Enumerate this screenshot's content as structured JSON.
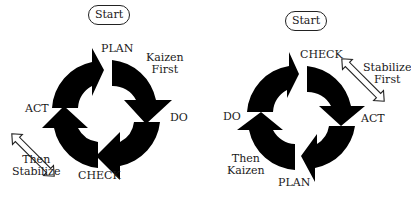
{
  "diagrams": [
    {
      "id": "left",
      "start_label": "Start",
      "stages": {
        "top": "PLAN",
        "right": "DO",
        "bottom": "CHECK",
        "left": "ACT"
      },
      "first_annotation": [
        "Kaizen",
        "First"
      ],
      "then_annotation": [
        "Then",
        "Stabilize"
      ]
    },
    {
      "id": "right",
      "start_label": "Start",
      "stages": {
        "top": "CHECK",
        "right": "ACT",
        "bottom": "PLAN",
        "left": "DO"
      },
      "first_annotation": [
        "Stabilize",
        "First"
      ],
      "then_annotation": [
        "Then",
        "Kaizen"
      ]
    }
  ],
  "colors": {
    "arrow_fill": "#000000",
    "outline": "#222222",
    "background": "#ffffff"
  }
}
